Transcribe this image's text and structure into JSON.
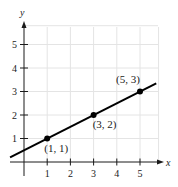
{
  "chart_data": {
    "type": "line",
    "title": "",
    "xlabel": "x",
    "ylabel": "y",
    "xlim": [
      -0.6,
      6
    ],
    "ylim": [
      -0.3,
      6
    ],
    "grid": true,
    "x_ticks": [
      1,
      2,
      3,
      4,
      5
    ],
    "y_ticks": [
      1,
      2,
      3,
      4,
      5
    ],
    "x_tick_labels": [
      "1",
      "2",
      "3",
      "4",
      "5"
    ],
    "y_tick_labels": [
      "1",
      "2",
      "3",
      "4",
      "5"
    ],
    "series": [
      {
        "name": "line",
        "equation": "y = 0.5x + 0.5",
        "x": [
          -0.6,
          5.7
        ],
        "y": [
          0.2,
          3.35
        ]
      }
    ],
    "points": [
      {
        "x": 1,
        "y": 1,
        "label": "(1, 1)"
      },
      {
        "x": 3,
        "y": 2,
        "label": "(3, 2)"
      },
      {
        "x": 5,
        "y": 3,
        "label": "(5, 3)"
      }
    ],
    "legend": null,
    "colors": {
      "line": "#000000",
      "grid": "#e4e4e4",
      "axis": "#1a1a1a"
    }
  }
}
